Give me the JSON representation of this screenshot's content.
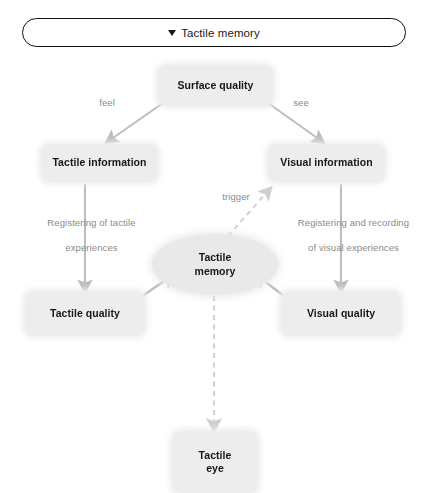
{
  "header": {
    "caret_icon": "caret-down-icon",
    "title": "Tactile memory"
  },
  "diagram": {
    "type": "flowchart",
    "background_color": "#ffffff",
    "node_fill_color": "#ededed",
    "node_text_color": "#161616",
    "edge_color": "#b3b3b3",
    "label_text_color": "#8a8a8a",
    "nodes": [
      {
        "id": "surface_quality",
        "label": "Surface quality",
        "shape": "rounded-rect"
      },
      {
        "id": "tactile_information",
        "label": "Tactile information",
        "shape": "rounded-rect"
      },
      {
        "id": "visual_information",
        "label": "Visual information",
        "shape": "rounded-rect"
      },
      {
        "id": "tactile_memory",
        "label": "Tactile\nmemory",
        "shape": "ellipse"
      },
      {
        "id": "tactile_quality",
        "label": "Tactile quality",
        "shape": "rounded-rect"
      },
      {
        "id": "visual_quality",
        "label": "Visual quality",
        "shape": "rounded-rect"
      },
      {
        "id": "tactile_eye",
        "label": "Tactile\neye",
        "shape": "rounded-rect"
      }
    ],
    "edge_labels": {
      "feel": "feel",
      "see": "see",
      "trigger": "trigger",
      "registering_tactile": "Registering of tactile\nexperiences",
      "registering_visual": "Registering and recording\nof visual experiences"
    },
    "edges": [
      {
        "from": "surface_quality",
        "to": "tactile_information",
        "label": "feel",
        "style": "solid"
      },
      {
        "from": "surface_quality",
        "to": "visual_information",
        "label": "see",
        "style": "solid"
      },
      {
        "from": "tactile_information",
        "to": "tactile_quality",
        "label": "Registering of tactile experiences",
        "style": "solid"
      },
      {
        "from": "visual_information",
        "to": "visual_quality",
        "label": "Registering and recording of visual experiences",
        "style": "solid"
      },
      {
        "from": "tactile_quality",
        "to": "tactile_memory",
        "label": "",
        "style": "solid"
      },
      {
        "from": "visual_quality",
        "to": "tactile_memory",
        "label": "",
        "style": "solid"
      },
      {
        "from": "tactile_memory",
        "to": "visual_information",
        "label": "trigger",
        "style": "dashed"
      },
      {
        "from": "tactile_memory",
        "to": "tactile_eye",
        "label": "",
        "style": "dashed"
      }
    ]
  },
  "node_labels": {
    "surface_quality": "Surface quality",
    "tactile_information": "Tactile information",
    "visual_information": "Visual information",
    "tactile_memory_line1": "Tactile",
    "tactile_memory_line2": "memory",
    "tactile_quality": "Tactile quality",
    "visual_quality": "Visual quality",
    "tactile_eye_line1": "Tactile",
    "tactile_eye_line2": "eye"
  },
  "edge_label_text": {
    "feel": "feel",
    "see": "see",
    "trigger": "trigger",
    "registering_tactile_line1": "Registering of tactile",
    "registering_tactile_line2": "experiences",
    "registering_visual_line1": "Registering and recording",
    "registering_visual_line2": "of visual experiences"
  }
}
